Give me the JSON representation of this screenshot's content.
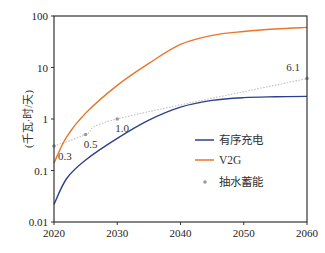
{
  "chart_data": {
    "type": "line",
    "title": "",
    "xlabel": "",
    "ylabel": "(千瓦·时/天)",
    "xlim": [
      2020,
      2060
    ],
    "ylim": [
      0.01,
      100
    ],
    "yscale": "log",
    "x_ticks": [
      "2020",
      "2030",
      "2040",
      "2050",
      "2060"
    ],
    "y_ticks": [
      "0.01",
      "0.1",
      "1",
      "10",
      "100"
    ],
    "grid": false,
    "legend_position": "bottom-right",
    "series": [
      {
        "name": "有序充电",
        "color": "#2e3f8f",
        "style": "line",
        "x": [
          2020,
          2022,
          2025,
          2030,
          2035,
          2040,
          2045,
          2050,
          2055,
          2060
        ],
        "values": [
          0.022,
          0.07,
          0.16,
          0.42,
          0.95,
          1.7,
          2.3,
          2.6,
          2.7,
          2.75
        ]
      },
      {
        "name": "V2G",
        "color": "#e8762b",
        "style": "line",
        "x": [
          2020,
          2022,
          2025,
          2030,
          2035,
          2040,
          2045,
          2050,
          2055,
          2060
        ],
        "values": [
          0.14,
          0.45,
          1.3,
          4.5,
          12,
          28,
          42,
          50,
          56,
          60
        ]
      },
      {
        "name": "抽水蓄能",
        "color": "#9a9a9a",
        "style": "dotted-with-markers",
        "x": [
          2020,
          2025,
          2030,
          2060
        ],
        "values": [
          0.3,
          0.5,
          1.0,
          6.1
        ],
        "labels": [
          "0.3",
          "0.5",
          "1.0",
          "6.1"
        ]
      }
    ]
  }
}
